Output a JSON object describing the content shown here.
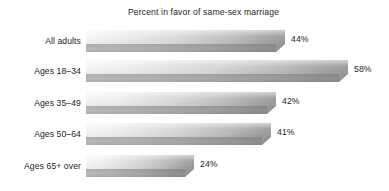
{
  "chart_data": {
    "type": "bar",
    "orientation": "horizontal",
    "title": "Percent in favor of same-sex marriage",
    "xlabel": "",
    "ylabel": "",
    "categories": [
      "All adults",
      "Ages 18–34",
      "Ages 35–49",
      "Ages 50–64",
      "Ages 65+ over"
    ],
    "values": [
      44,
      58,
      42,
      41,
      24
    ],
    "value_labels": [
      "44%",
      "58%",
      "42%",
      "41%",
      "24%"
    ],
    "xlim": [
      0,
      58
    ],
    "grid": false,
    "legend": null,
    "style": {
      "bar_fill_light": "#f6f6f6",
      "bar_fill_dark": "#9b9b9b",
      "bar_front_light": "#b8b8b8",
      "bar_front_dark": "#8c8c8c",
      "text_color": "#1c1c1c",
      "background": "#ffffff"
    }
  }
}
